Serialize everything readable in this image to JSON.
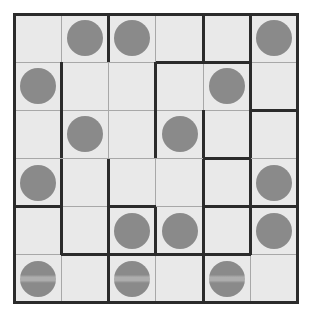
{
  "puzzle": {
    "title": "Grid Region Puzzle",
    "type": "region-grid",
    "rows": 6,
    "cols": 6,
    "colors": {
      "page_background": "#ffffff",
      "cell_fill": "#e9e9e9",
      "thin_line": "#a8a8a8",
      "thick_line": "#2b2b2b",
      "disc_fill": "#8a8a8a"
    },
    "geometry": {
      "board_left": 14,
      "board_top": 14,
      "board_width": 284,
      "board_height": 289,
      "cell_width": 47.33,
      "cell_height": 48.17,
      "thin_line_width": 1,
      "thick_line_width": 3,
      "disc_diameter": 36
    },
    "discs": [
      {
        "row": 1,
        "col": 2,
        "banded": false
      },
      {
        "row": 1,
        "col": 3,
        "banded": false
      },
      {
        "row": 1,
        "col": 6,
        "banded": false
      },
      {
        "row": 2,
        "col": 1,
        "banded": false
      },
      {
        "row": 2,
        "col": 5,
        "banded": false
      },
      {
        "row": 3,
        "col": 2,
        "banded": false
      },
      {
        "row": 3,
        "col": 4,
        "banded": false
      },
      {
        "row": 4,
        "col": 1,
        "banded": false
      },
      {
        "row": 4,
        "col": 6,
        "banded": false
      },
      {
        "row": 5,
        "col": 3,
        "banded": false
      },
      {
        "row": 5,
        "col": 4,
        "banded": false
      },
      {
        "row": 5,
        "col": 6,
        "banded": false
      },
      {
        "row": 6,
        "col": 1,
        "banded": true
      },
      {
        "row": 6,
        "col": 3,
        "banded": true
      },
      {
        "row": 6,
        "col": 5,
        "banded": true
      }
    ],
    "disc_count": 15,
    "vertical_thick_edges": [
      {
        "row": 1,
        "after_col": 2
      },
      {
        "row": 1,
        "after_col": 4
      },
      {
        "row": 1,
        "after_col": 5
      },
      {
        "row": 2,
        "after_col": 1
      },
      {
        "row": 2,
        "after_col": 3
      },
      {
        "row": 2,
        "after_col": 5
      },
      {
        "row": 3,
        "after_col": 1
      },
      {
        "row": 3,
        "after_col": 3
      },
      {
        "row": 3,
        "after_col": 4
      },
      {
        "row": 3,
        "after_col": 5
      },
      {
        "row": 4,
        "after_col": 1
      },
      {
        "row": 4,
        "after_col": 2
      },
      {
        "row": 4,
        "after_col": 4
      },
      {
        "row": 4,
        "after_col": 5
      },
      {
        "row": 5,
        "after_col": 1
      },
      {
        "row": 5,
        "after_col": 2
      },
      {
        "row": 5,
        "after_col": 3
      },
      {
        "row": 5,
        "after_col": 4
      },
      {
        "row": 5,
        "after_col": 5
      },
      {
        "row": 6,
        "after_col": 2
      },
      {
        "row": 6,
        "after_col": 4
      }
    ],
    "horizontal_thick_edges": [
      {
        "after_row": 1,
        "col": 4
      },
      {
        "after_row": 1,
        "col": 5
      },
      {
        "after_row": 2,
        "col": 6
      },
      {
        "after_row": 3,
        "col": 5
      },
      {
        "after_row": 4,
        "col": 1
      },
      {
        "after_row": 4,
        "col": 3
      },
      {
        "after_row": 4,
        "col": 5
      },
      {
        "after_row": 4,
        "col": 6
      },
      {
        "after_row": 5,
        "col": 2
      },
      {
        "after_row": 5,
        "col": 3
      },
      {
        "after_row": 5,
        "col": 4
      },
      {
        "after_row": 5,
        "col": 5
      }
    ]
  }
}
